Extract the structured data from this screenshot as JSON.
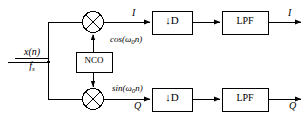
{
  "diagram": {
    "background_color": "#ffffff",
    "line_color": "#000000",
    "input": {
      "signal_name": "x(n)",
      "sample_rate": "f",
      "sample_rate_sub": "s"
    },
    "nco": {
      "label": "NCO"
    },
    "mixers": [
      {
        "name": "top-mixer",
        "symbol": "multiply"
      },
      {
        "name": "bottom-mixer",
        "symbol": "multiply"
      }
    ],
    "carriers": {
      "cosine": {
        "prefix": "cos(",
        "omega": "ω",
        "sub": "0",
        "var": "n",
        "suffix": ")"
      },
      "sine": {
        "prefix": "sin(",
        "omega": "ω",
        "sub": "0",
        "var": "n",
        "suffix": ")"
      }
    },
    "branches": [
      {
        "name": "in-phase",
        "mixer_output_label": "I",
        "decimator_label": "↓D",
        "filter_label": "LPF",
        "output_label": "I"
      },
      {
        "name": "quadrature",
        "mixer_output_label": "Q",
        "decimator_label": "↓D",
        "filter_label": "LPF",
        "output_label": "Q"
      }
    ]
  }
}
